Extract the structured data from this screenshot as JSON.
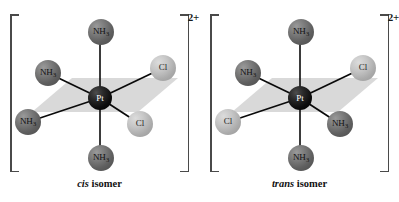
{
  "figure": {
    "background_color": "#ffffff"
  },
  "colors": {
    "nh3_sphere": "#6f6f6f",
    "cl_sphere": "#bcbcbc",
    "pt_sphere": "#0d0d0d",
    "pt_label": "#ffffff",
    "plane_fill": "#d9d9d9",
    "bond_line": "#0a0a0a",
    "bracket": "#4a4a4a",
    "text": "#111111"
  },
  "complexes": [
    {
      "id": "cis",
      "charge": "2+",
      "center": {
        "label": "Pt",
        "name": "platinum"
      },
      "caption": {
        "emphasis": "cis",
        "rest": "isomer"
      },
      "ligands": [
        {
          "position": "axial-top",
          "label_main": "NH",
          "label_sub": "3",
          "type": "nh3"
        },
        {
          "position": "equatorial-upper-left",
          "label_main": "NH",
          "label_sub": "3",
          "type": "nh3"
        },
        {
          "position": "equatorial-upper-right",
          "label_main": "Cl",
          "label_sub": "",
          "type": "cl"
        },
        {
          "position": "equatorial-lower-left",
          "label_main": "NH",
          "label_sub": "3",
          "type": "nh3"
        },
        {
          "position": "equatorial-lower-right",
          "label_main": "Cl",
          "label_sub": "",
          "type": "cl"
        },
        {
          "position": "axial-bottom",
          "label_main": "NH",
          "label_sub": "3",
          "type": "nh3"
        }
      ]
    },
    {
      "id": "trans",
      "charge": "2+",
      "center": {
        "label": "Pt",
        "name": "platinum"
      },
      "caption": {
        "emphasis": "trans",
        "rest": "isomer"
      },
      "ligands": [
        {
          "position": "axial-top",
          "label_main": "NH",
          "label_sub": "3",
          "type": "nh3"
        },
        {
          "position": "equatorial-upper-left",
          "label_main": "NH",
          "label_sub": "3",
          "type": "nh3"
        },
        {
          "position": "equatorial-upper-right",
          "label_main": "Cl",
          "label_sub": "",
          "type": "cl"
        },
        {
          "position": "equatorial-lower-left",
          "label_main": "Cl",
          "label_sub": "",
          "type": "cl"
        },
        {
          "position": "equatorial-lower-right",
          "label_main": "NH",
          "label_sub": "3",
          "type": "nh3"
        },
        {
          "position": "axial-bottom",
          "label_main": "NH",
          "label_sub": "3",
          "type": "nh3"
        }
      ]
    }
  ]
}
